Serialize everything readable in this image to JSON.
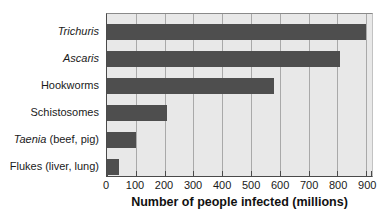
{
  "chart_data": {
    "type": "bar",
    "orientation": "horizontal",
    "xlabel": "Number of people infected (millions)",
    "categories": [
      "Trichuris",
      "Ascaris",
      "Hookworms",
      "Schistosomes",
      "Taenia (beef, pig)",
      "Flukes (liver, lung)"
    ],
    "category_parts": [
      {
        "italic": "Trichuris",
        "regular": ""
      },
      {
        "italic": "Ascaris",
        "regular": ""
      },
      {
        "italic": "",
        "regular": "Hookworms"
      },
      {
        "italic": "",
        "regular": "Schistosomes"
      },
      {
        "italic": "Taenia",
        "regular": " (beef, pig)"
      },
      {
        "italic": "",
        "regular": "Flukes (liver, lung)"
      }
    ],
    "values": [
      900,
      810,
      580,
      210,
      100,
      40
    ],
    "x_ticks": [
      0,
      100,
      200,
      300,
      400,
      500,
      600,
      700,
      800,
      900
    ],
    "xlim": [
      0,
      920
    ],
    "grid": true,
    "legend": false,
    "colors": {
      "bar": "#4e4e4e",
      "plot_background": "#e8e8e8",
      "gridline": "#a9a9a9",
      "axis": "#4a4a4a",
      "text": "#1a1a1a"
    }
  }
}
